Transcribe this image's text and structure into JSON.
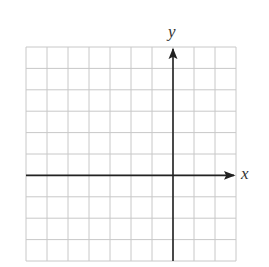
{
  "diagram": {
    "type": "coordinate-grid",
    "grid": {
      "columns": 10,
      "rows": 10,
      "left": 26,
      "top": 47,
      "cell_width": 21,
      "cell_height": 21.4,
      "line_color": "#c8c8c8"
    },
    "axes": {
      "y_axis_column": 7,
      "x_axis_row": 6,
      "color": "#222222",
      "x_label": "x",
      "y_label": "y"
    }
  }
}
